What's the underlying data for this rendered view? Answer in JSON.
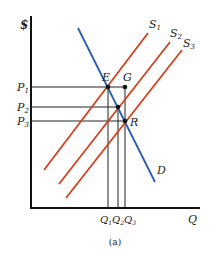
{
  "figure": {
    "caption": "(a)",
    "axes": {
      "y_label": "$",
      "x_label": "Q"
    },
    "prices": [
      {
        "id": "P1",
        "main": "P",
        "sub": "1",
        "y": 87
      },
      {
        "id": "P2",
        "main": "P",
        "sub": "2",
        "y": 107
      },
      {
        "id": "P3",
        "main": "P",
        "sub": "3",
        "y": 121
      }
    ],
    "quantities": [
      {
        "id": "Q1",
        "main": "Q",
        "sub": "1",
        "x": 108
      },
      {
        "id": "Q2",
        "main": "Q",
        "sub": "2",
        "x": 118
      },
      {
        "id": "Q3",
        "main": "Q",
        "sub": "3",
        "x": 125
      }
    ],
    "curves": {
      "demand": {
        "label": "D",
        "color": "#2a5db0"
      },
      "supply": [
        {
          "main": "S",
          "sub": "1",
          "color": "#d2401e"
        },
        {
          "main": "S",
          "sub": "2",
          "color": "#d2401e"
        },
        {
          "main": "S",
          "sub": "3",
          "color": "#d2401e"
        }
      ]
    },
    "points": [
      {
        "label": "E"
      },
      {
        "label": "G"
      },
      {
        "label": "R"
      }
    ]
  }
}
